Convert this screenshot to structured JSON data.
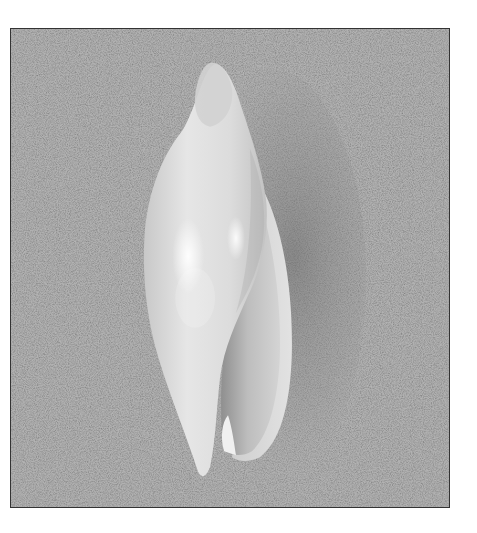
{
  "image": {
    "subject": "seashell",
    "description": "Elongated white olive-like seashell lying on fine gray sand, aperture facing right, grayscale photograph inside a thin dark border",
    "background": "sand",
    "colors": {
      "sand": "#b8b8b8",
      "sand_dark": "#8e8e8e",
      "shell_light": "#f2f2f2",
      "shell_mid": "#d6d6d6",
      "shell_shadow": "#a8a8a8",
      "aperture": "#c4c4c4",
      "border": "#333333",
      "page": "#ffffff"
    }
  }
}
